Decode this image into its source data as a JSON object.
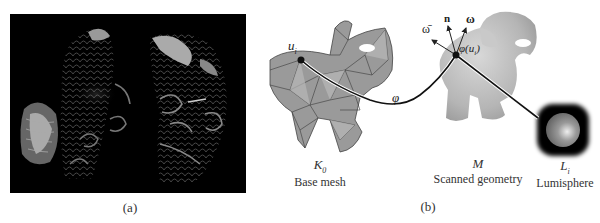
{
  "figure": {
    "panel_a": {
      "caption": "(a)",
      "description": "Two koi fish renderings on black background"
    },
    "panel_b": {
      "caption": "(b)",
      "base_mesh": {
        "symbol": "K",
        "subscript": "0",
        "label": "Base mesh"
      },
      "scanned": {
        "symbol": "M",
        "label": "Scanned geometry"
      },
      "lumisphere": {
        "symbol": "L",
        "subscript": "i",
        "label": "Lumisphere"
      },
      "point_u": {
        "symbol": "u",
        "subscript": "i"
      },
      "map_phi": "φ",
      "phi_u": "φ(u",
      "phi_u_sub": "i",
      "phi_u_close": ")",
      "vec_n": "n",
      "vec_omega": "ω",
      "vec_omega_bar": "ω̄"
    }
  }
}
